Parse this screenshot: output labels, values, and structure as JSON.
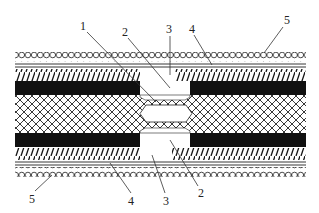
{
  "diagram": {
    "type": "cross-section",
    "layers_top_to_bottom": [
      {
        "id": "5",
        "name": "outer circular wire layer (top)"
      },
      {
        "id": "4",
        "name": "double line sheath (top)"
      },
      {
        "id": "hatch-top",
        "name": "diagonal hatched layer (top)"
      },
      {
        "id": "black-top",
        "name": "solid black layer (top)"
      },
      {
        "id": "core",
        "name": "crosshatched mesh core"
      },
      {
        "id": "black-bottom",
        "name": "solid black layer (bottom)"
      },
      {
        "id": "hatch-bottom",
        "name": "diagonal hatched layer (bottom)"
      },
      {
        "id": "4b",
        "name": "double line sheath (bottom)"
      },
      {
        "id": "5b",
        "name": "outer circular wire layer (bottom)"
      }
    ],
    "labels_top": [
      {
        "text": "1",
        "x": 84,
        "y": 30
      },
      {
        "text": "2",
        "x": 126,
        "y": 36
      },
      {
        "text": "3",
        "x": 170,
        "y": 33
      },
      {
        "text": "4",
        "x": 192,
        "y": 33
      },
      {
        "text": "5",
        "x": 287,
        "y": 24
      }
    ],
    "labels_bottom": [
      {
        "text": "5",
        "x": 32,
        "y": 203
      },
      {
        "text": "4",
        "x": 131,
        "y": 205
      },
      {
        "text": "3",
        "x": 167,
        "y": 205
      },
      {
        "text": "2",
        "x": 201,
        "y": 197
      }
    ]
  },
  "colors": {
    "ink": "#111111",
    "background": "#ffffff"
  }
}
